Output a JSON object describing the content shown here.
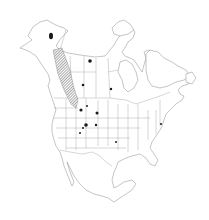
{
  "map": {
    "type": "species-distribution",
    "region": "North America",
    "colors": {
      "background": "#ffffff",
      "outline": "#8a8a8a",
      "range_hatch": "#555555",
      "occurrence_dot": "#1a1a1a"
    },
    "range_area": {
      "style": "hatched",
      "description": "Continuous range band from Yukon south through British Columbia / Alberta Rockies into northern Idaho/Montana",
      "polygon": [
        [
          53,
          50
        ],
        [
          62,
          48
        ],
        [
          70,
          70
        ],
        [
          74,
          88
        ],
        [
          78,
          100
        ],
        [
          76,
          108
        ],
        [
          71,
          104
        ],
        [
          64,
          90
        ],
        [
          58,
          74
        ],
        [
          55,
          60
        ]
      ]
    },
    "occurrence_points": [
      {
        "label": "Alaska interior",
        "x": 51,
        "y": 36,
        "size": "large"
      },
      {
        "label": "Northwest Territories",
        "x": 90,
        "y": 61,
        "size": "medium"
      },
      {
        "label": "Alberta",
        "x": 83,
        "y": 85,
        "size": "small"
      },
      {
        "label": "Saskatchewan",
        "x": 111,
        "y": 89,
        "size": "small"
      },
      {
        "label": "Idaho/Montana",
        "x": 81,
        "y": 110,
        "size": "medium"
      },
      {
        "label": "Montana",
        "x": 87,
        "y": 106,
        "size": "small"
      },
      {
        "label": "Wyoming/South Dakota",
        "x": 97,
        "y": 113,
        "size": "medium"
      },
      {
        "label": "Utah north",
        "x": 86,
        "y": 125,
        "size": "large"
      },
      {
        "label": "Colorado",
        "x": 96,
        "y": 125,
        "size": "small"
      },
      {
        "label": "Utah south",
        "x": 83,
        "y": 128,
        "size": "small"
      },
      {
        "label": "Arizona",
        "x": 80,
        "y": 133,
        "size": "small"
      },
      {
        "label": "Oklahoma",
        "x": 116,
        "y": 142,
        "size": "small"
      },
      {
        "label": "New Jersey",
        "x": 161,
        "y": 124,
        "size": "small"
      }
    ]
  }
}
